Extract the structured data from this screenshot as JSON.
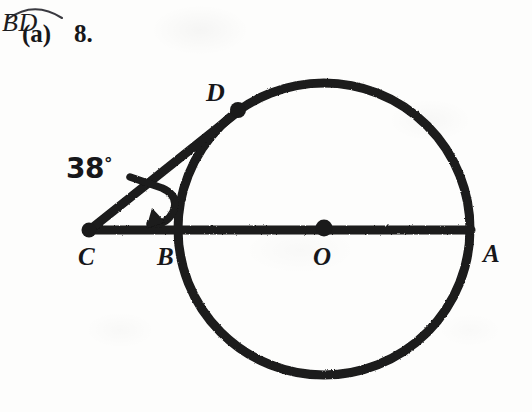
{
  "header": {
    "part_letter": "(a)",
    "problem_number": "8.",
    "arc_label": "BD",
    "arc_symbol": "arc-over-bar"
  },
  "figure": {
    "type": "circle-secant-geometry",
    "caption_subject": "arc BD",
    "angle": {
      "vertex": "C",
      "value_text": "38",
      "degree_symbol": "°",
      "measure_degrees": 38,
      "pointer": "curved-arrow"
    },
    "circle": {
      "center_label": "O",
      "center_x": 324,
      "center_y": 229,
      "radius": 146,
      "stroke_color": "#1a1a1a",
      "stroke_width": 9
    },
    "points": [
      {
        "label": "C",
        "x": 89,
        "y": 230,
        "on_circle": false,
        "dot": true,
        "role": "external-vertex"
      },
      {
        "label": "B",
        "x": 179,
        "y": 230,
        "on_circle": true,
        "dot": false,
        "role": "near-intersection"
      },
      {
        "label": "O",
        "x": 324,
        "y": 229,
        "on_circle": false,
        "dot": true,
        "role": "center"
      },
      {
        "label": "A",
        "x": 470,
        "y": 230,
        "on_circle": true,
        "dot": false,
        "role": "far-intersection"
      },
      {
        "label": "D",
        "x": 238,
        "y": 110,
        "on_circle": true,
        "dot": true,
        "role": "secant-intersection"
      }
    ],
    "lines": [
      {
        "name": "secant-CA",
        "from": "C",
        "to": "A",
        "through": [
          "B",
          "O"
        ]
      },
      {
        "name": "secant-CD",
        "from": "C",
        "to": "D"
      }
    ],
    "colors": {
      "ink": "#1a1a1a",
      "paper": "#fdfdfc"
    }
  }
}
